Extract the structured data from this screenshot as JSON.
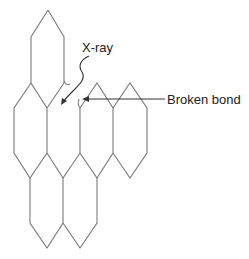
{
  "diagram": {
    "type": "graphene-lattice-xray-damage",
    "colors": {
      "line": "#7a7a7a",
      "text": "#222222",
      "arrow": "#333333",
      "background": "#ffffff"
    },
    "labels": {
      "xray": "X-ray",
      "broken_bond": "Broken bond"
    }
  }
}
